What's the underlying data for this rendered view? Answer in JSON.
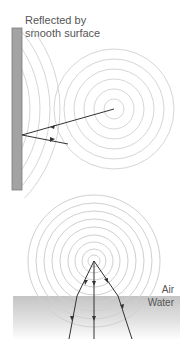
{
  "top_diagram": {
    "title_line1": "Reflected by",
    "title_line2": "smooth surface",
    "wall": {
      "x": 12,
      "y": 28,
      "width": 10,
      "height": 162,
      "fill": "#a0a0a0",
      "stroke": "#777777"
    },
    "source": {
      "x": 114,
      "y": 109
    },
    "ring_radii": [
      10,
      20,
      30,
      40,
      50,
      60
    ],
    "reflected_center": {
      "x": -70,
      "y": 109
    },
    "reflected_radii": [
      90,
      100,
      110,
      120,
      130
    ],
    "incident_ray": {
      "from": [
        114,
        109
      ],
      "to": [
        22,
        135
      ]
    },
    "reflected_ray": {
      "from": [
        22,
        135
      ],
      "to": [
        68,
        143
      ]
    }
  },
  "bottom_diagram": {
    "label_air": "Air",
    "label_water": "Water",
    "source": {
      "x": 94,
      "y": 261
    },
    "ring_radii": [
      6,
      12,
      19,
      26,
      34,
      42,
      50,
      58,
      66
    ],
    "water_surface_y": 296,
    "water_color": "#c8c8c8",
    "rays": [
      {
        "points": [
          [
            94,
            261
          ],
          [
            77,
            296
          ],
          [
            69,
            339
          ]
        ]
      },
      {
        "points": [
          [
            94,
            261
          ],
          [
            94,
            339
          ]
        ]
      },
      {
        "points": [
          [
            94,
            261
          ],
          [
            118,
            296
          ],
          [
            132,
            339
          ]
        ]
      }
    ]
  },
  "colors": {
    "ring": "#d4d4d4",
    "ray": "#333333",
    "text": "#555555"
  }
}
